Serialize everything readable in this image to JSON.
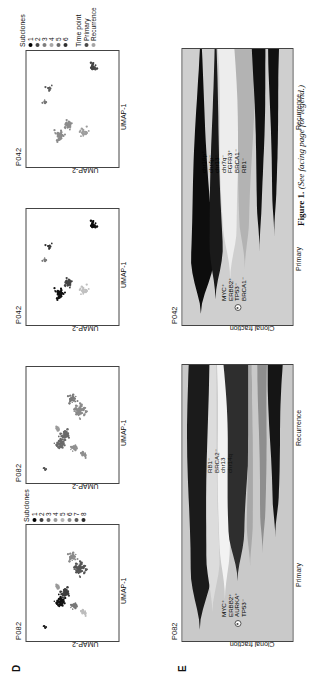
{
  "figure": {
    "caption_bold": "Figure 1.",
    "caption_italic": "(See facing page for legend.)"
  },
  "panels": {
    "D": {
      "letter": "D"
    },
    "E": {
      "letter": "E"
    }
  },
  "umap_panels": [
    {
      "id": "d1",
      "title": "P082",
      "xlabel": "UMAP-1",
      "ylabel": "UMAP-2",
      "legend": {
        "title": "Subclones",
        "items": [
          {
            "label": "1",
            "color": "#000000"
          },
          {
            "label": "2",
            "color": "#3d3d3d"
          },
          {
            "label": "3",
            "color": "#6e6e6e"
          },
          {
            "label": "4",
            "color": "#9a9a9a"
          },
          {
            "label": "5",
            "color": "#b5b5b5"
          },
          {
            "label": "6",
            "color": "#8a8a8a"
          },
          {
            "label": "7",
            "color": "#5a5a5a"
          },
          {
            "label": "8",
            "color": "#2b2b2b"
          }
        ]
      }
    },
    {
      "id": "d2",
      "title": "P082",
      "xlabel": "UMAP-1",
      "ylabel": "UMAP-2",
      "legend": null
    },
    {
      "id": "d3",
      "title": "P042",
      "xlabel": "UMAP-1",
      "ylabel": "UMAP-2",
      "legend": null
    },
    {
      "id": "d4",
      "title": "P042",
      "xlabel": "UMAP-1",
      "ylabel": "UMAP-2",
      "legend": {
        "title": "Subclones",
        "items": [
          {
            "label": "1",
            "color": "#000000"
          },
          {
            "label": "2",
            "color": "#474747"
          },
          {
            "label": "3",
            "color": "#7d7d7d"
          },
          {
            "label": "4",
            "color": "#a8a8a8"
          },
          {
            "label": "5",
            "color": "#6a6a6a"
          },
          {
            "label": "6",
            "color": "#303030"
          }
        ]
      },
      "legend2": {
        "title": "Time point",
        "items": [
          {
            "label": "Primary",
            "color": "#4a4a4a"
          },
          {
            "label": "Recurrence",
            "color": "#a5a5a5"
          }
        ]
      }
    }
  ],
  "fish_panels": [
    {
      "id": "e1",
      "title": "P082",
      "ylabel": "Clonal fraction",
      "xticks": [
        "Primary",
        "Recurrence"
      ],
      "primary_genes": [
        "MYC⁺",
        "ERBB2⁺",
        "AURKA⁺",
        "TP53⁻"
      ],
      "recurrence_genes": [
        "RB1⁻",
        "BRCA2⁻",
        "chr13",
        "chr14q"
      ]
    },
    {
      "id": "e2",
      "title": "P042",
      "ylabel": "Clonal fraction",
      "xticks": [
        "Primary",
        "Recurrence"
      ],
      "primary_genes": [
        "MYC⁺",
        "ERBB2⁺",
        "TP53⁻",
        "BRCA1⁻"
      ],
      "recurrence_genes": [
        "chr16p⁺",
        "chr4p⁻",
        "chr13⁻",
        "chr7q⁻",
        "FGFR3⁺",
        "BRCA1⁻",
        "RB1⁻"
      ]
    }
  ],
  "chart_data": [
    {
      "type": "scatter",
      "panel": "D",
      "id": "d1",
      "title": "P082",
      "xlabel": "UMAP-1",
      "ylabel": "UMAP-2",
      "color_by": "Subclones",
      "legend_entries": [
        "1",
        "2",
        "3",
        "4",
        "5",
        "6",
        "7",
        "8"
      ],
      "clusters": [
        {
          "name": "cluster-1",
          "cx": 0.34,
          "cy": 0.36,
          "n": 55,
          "spread": 0.055,
          "shade": "#111111"
        },
        {
          "name": "cluster-2",
          "cx": 0.41,
          "cy": 0.42,
          "n": 40,
          "spread": 0.045,
          "shade": "#3d3d3d"
        },
        {
          "name": "cluster-3",
          "cx": 0.3,
          "cy": 0.52,
          "n": 25,
          "spread": 0.035,
          "shade": "#777777"
        },
        {
          "name": "cluster-4",
          "cx": 0.25,
          "cy": 0.62,
          "n": 18,
          "spread": 0.035,
          "shade": "#bdbdbd"
        },
        {
          "name": "cluster-5",
          "cx": 0.63,
          "cy": 0.58,
          "n": 70,
          "spread": 0.075,
          "shade": "#555555"
        },
        {
          "name": "cluster-6",
          "cx": 0.72,
          "cy": 0.5,
          "n": 30,
          "spread": 0.05,
          "shade": "#8a8a8a"
        },
        {
          "name": "cluster-7",
          "cx": 0.12,
          "cy": 0.2,
          "n": 6,
          "spread": 0.02,
          "shade": "#222222"
        },
        {
          "name": "cluster-8",
          "cx": 0.47,
          "cy": 0.34,
          "n": 12,
          "spread": 0.025,
          "shade": "#999999"
        }
      ]
    },
    {
      "type": "scatter",
      "panel": "D",
      "id": "d2",
      "title": "P082",
      "xlabel": "UMAP-1",
      "ylabel": "UMAP-2",
      "color_by": "Time point",
      "legend_entries": [
        "Primary",
        "Recurrence"
      ],
      "clusters": [
        {
          "name": "cluster-1",
          "cx": 0.34,
          "cy": 0.36,
          "n": 55,
          "spread": 0.055,
          "shade": "#6a6a6a"
        },
        {
          "name": "cluster-2",
          "cx": 0.41,
          "cy": 0.42,
          "n": 40,
          "spread": 0.045,
          "shade": "#6a6a6a"
        },
        {
          "name": "cluster-3",
          "cx": 0.3,
          "cy": 0.52,
          "n": 25,
          "spread": 0.035,
          "shade": "#8f8f8f"
        },
        {
          "name": "cluster-4",
          "cx": 0.25,
          "cy": 0.62,
          "n": 18,
          "spread": 0.035,
          "shade": "#8f8f8f"
        },
        {
          "name": "cluster-5",
          "cx": 0.63,
          "cy": 0.58,
          "n": 70,
          "spread": 0.075,
          "shade": "#8a8a8a"
        },
        {
          "name": "cluster-6",
          "cx": 0.72,
          "cy": 0.5,
          "n": 30,
          "spread": 0.05,
          "shade": "#7a7a7a"
        },
        {
          "name": "cluster-7",
          "cx": 0.12,
          "cy": 0.2,
          "n": 6,
          "spread": 0.02,
          "shade": "#555555"
        },
        {
          "name": "cluster-8",
          "cx": 0.47,
          "cy": 0.34,
          "n": 12,
          "spread": 0.025,
          "shade": "#9a9a9a"
        }
      ]
    },
    {
      "type": "scatter",
      "panel": "D",
      "id": "d3",
      "title": "P042",
      "xlabel": "UMAP-1",
      "ylabel": "UMAP-2",
      "color_by": "Subclones",
      "legend_entries": [
        "1",
        "2",
        "3",
        "4",
        "5",
        "6"
      ],
      "clusters": [
        {
          "name": "cluster-1",
          "cx": 0.27,
          "cy": 0.36,
          "n": 45,
          "spread": 0.05,
          "shade": "#111111"
        },
        {
          "name": "cluster-2",
          "cx": 0.36,
          "cy": 0.45,
          "n": 35,
          "spread": 0.045,
          "shade": "#444444"
        },
        {
          "name": "cluster-3",
          "cx": 0.3,
          "cy": 0.62,
          "n": 30,
          "spread": 0.04,
          "shade": "#c0c0c0"
        },
        {
          "name": "cluster-4",
          "cx": 0.68,
          "cy": 0.25,
          "n": 10,
          "spread": 0.03,
          "shade": "#333333"
        },
        {
          "name": "cluster-5",
          "cx": 0.86,
          "cy": 0.72,
          "n": 28,
          "spread": 0.04,
          "shade": "#0d0d0d"
        },
        {
          "name": "cluster-6",
          "cx": 0.56,
          "cy": 0.2,
          "n": 8,
          "spread": 0.02,
          "shade": "#7a7a7a"
        }
      ]
    },
    {
      "type": "scatter",
      "panel": "D",
      "id": "d4",
      "title": "P042",
      "xlabel": "UMAP-1",
      "ylabel": "UMAP-2",
      "color_by": "Time point",
      "legend_entries": [
        "Primary",
        "Recurrence"
      ],
      "clusters": [
        {
          "name": "cluster-1",
          "cx": 0.27,
          "cy": 0.36,
          "n": 45,
          "spread": 0.05,
          "shade": "#8c8c8c"
        },
        {
          "name": "cluster-2",
          "cx": 0.36,
          "cy": 0.45,
          "n": 35,
          "spread": 0.045,
          "shade": "#8c8c8c"
        },
        {
          "name": "cluster-3",
          "cx": 0.3,
          "cy": 0.62,
          "n": 30,
          "spread": 0.04,
          "shade": "#9e9e9e"
        },
        {
          "name": "cluster-4",
          "cx": 0.68,
          "cy": 0.25,
          "n": 10,
          "spread": 0.03,
          "shade": "#5a5a5a"
        },
        {
          "name": "cluster-5",
          "cx": 0.86,
          "cy": 0.72,
          "n": 28,
          "spread": 0.04,
          "shade": "#444444"
        },
        {
          "name": "cluster-6",
          "cx": 0.56,
          "cy": 0.2,
          "n": 8,
          "spread": 0.02,
          "shade": "#777777"
        }
      ]
    },
    {
      "type": "area",
      "panel": "E",
      "id": "e1",
      "title": "P082",
      "ylabel": "Clonal fraction",
      "x": [
        "Primary",
        "Recurrence"
      ],
      "note": "fishplot / clonal evolution stream",
      "clones": [
        {
          "name": "clone-1",
          "shade": "#c9c9c9",
          "primary": 1.0,
          "recurrence": 1.0
        },
        {
          "name": "clone-2",
          "shade": "#1b1b1b",
          "primary": 0.3,
          "recurrence": 0.34
        },
        {
          "name": "clone-3",
          "shade": "#dcdcdc",
          "primary": 0.22,
          "recurrence": 0.1
        },
        {
          "name": "clone-4",
          "shade": "#f2f2f2",
          "primary": 0.12,
          "recurrence": 0.26
        },
        {
          "name": "clone-5",
          "shade": "#2e2e2e",
          "primary": 0.18,
          "recurrence": 0.4
        },
        {
          "name": "clone-6",
          "shade": "#a8a8a8",
          "primary": 0.1,
          "recurrence": 0.05
        },
        {
          "name": "clone-7",
          "shade": "#8e8e8e",
          "primary": 0.06,
          "recurrence": 0.14
        },
        {
          "name": "clone-8",
          "shade": "#151515",
          "primary": 0.05,
          "recurrence": 0.22
        }
      ]
    },
    {
      "type": "area",
      "panel": "E",
      "id": "e2",
      "title": "P042",
      "ylabel": "Clonal fraction",
      "x": [
        "Primary",
        "Recurrence"
      ],
      "note": "fishplot / clonal evolution stream",
      "clones": [
        {
          "name": "clone-1",
          "shade": "#cfcfcf",
          "primary": 1.0,
          "recurrence": 1.0
        },
        {
          "name": "clone-2",
          "shade": "#0d0d0d",
          "primary": 0.42,
          "recurrence": 0.02
        },
        {
          "name": "clone-3",
          "shade": "#1a1a1a",
          "primary": 0.24,
          "recurrence": 0.01
        },
        {
          "name": "clone-4",
          "shade": "#ededed",
          "primary": 0.14,
          "recurrence": 0.4
        },
        {
          "name": "clone-5",
          "shade": "#b3b3b3",
          "primary": 0.1,
          "recurrence": 0.3
        },
        {
          "name": "clone-6",
          "shade": "#111111",
          "primary": 0.01,
          "recurrence": 0.2
        },
        {
          "name": "clone-7",
          "shade": "#101010",
          "primary": 0.01,
          "recurrence": 0.16
        }
      ]
    }
  ]
}
